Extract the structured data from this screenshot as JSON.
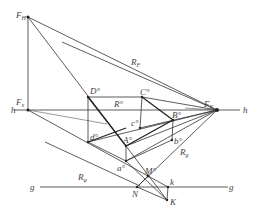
{
  "diagram": {
    "type": "perspective construction",
    "labels": {
      "FH": "F",
      "FH_sub": "H",
      "FX": "F",
      "FX_sub": "x",
      "FY": "F",
      "FY_sub": "Y",
      "h_left": "h",
      "h_right": "h",
      "g_left": "g",
      "g_right": "g",
      "RF": "R",
      "RF_sub": "F",
      "Rg": "R",
      "Rg_sub": "g",
      "Rphi": "R",
      "Rphi_sub": "φ",
      "Rprime": "R°",
      "D0": "D°",
      "C0": "C°",
      "c0": "c°",
      "B0": "B°",
      "b0": "b°",
      "d0": "d°",
      "A0": "A°",
      "a0": "a°",
      "M0": "M°",
      "N": "N",
      "k": "k",
      "K": "K"
    }
  }
}
